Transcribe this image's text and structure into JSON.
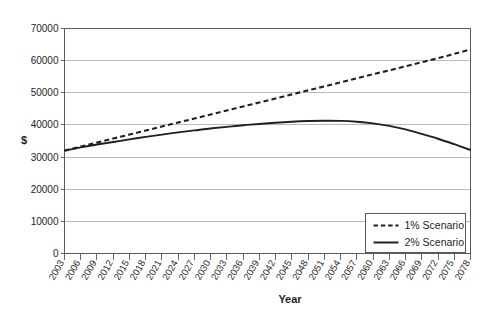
{
  "chart_data": {
    "type": "line",
    "title": "",
    "subtitle": "",
    "xlabel": "Year",
    "ylabel": "$",
    "xlim": [
      2003,
      2078
    ],
    "ylim": [
      0,
      70000
    ],
    "grid": true,
    "legend_position": "bottom-right",
    "ytick_labels": [
      "0",
      "10000",
      "20000",
      "30000",
      "40000",
      "50000",
      "60000",
      "70000"
    ],
    "ytick_values": [
      0,
      10000,
      20000,
      30000,
      40000,
      50000,
      60000,
      70000
    ],
    "categories": [
      "2003",
      "2006",
      "2009",
      "2012",
      "2015",
      "2018",
      "2021",
      "2024",
      "2027",
      "2030",
      "2033",
      "2036",
      "2039",
      "2042",
      "2045",
      "2048",
      "2051",
      "2054",
      "2057",
      "2060",
      "2063",
      "2066",
      "2069",
      "2072",
      "2075",
      "2078"
    ],
    "x": [
      2003,
      2006,
      2009,
      2012,
      2015,
      2018,
      2021,
      2024,
      2027,
      2030,
      2033,
      2036,
      2039,
      2042,
      2045,
      2048,
      2051,
      2054,
      2057,
      2060,
      2063,
      2066,
      2069,
      2072,
      2075,
      2078
    ],
    "series": [
      {
        "name": "1% Scenario",
        "style": "dashed",
        "color": "#231f20",
        "values": [
          32000,
          33250,
          34500,
          35750,
          37000,
          38250,
          39500,
          40750,
          42000,
          43250,
          44500,
          45750,
          47000,
          48250,
          49500,
          50750,
          52000,
          53250,
          54500,
          55750,
          57000,
          58250,
          59500,
          60750,
          62100,
          63500
        ]
      },
      {
        "name": "2% Scenario",
        "style": "solid",
        "color": "#231f20",
        "values": [
          32000,
          33000,
          33900,
          34700,
          35500,
          36300,
          37000,
          37700,
          38300,
          38900,
          39400,
          39900,
          40300,
          40700,
          41000,
          41200,
          41300,
          41250,
          41000,
          40500,
          39700,
          38600,
          37200,
          35700,
          34000,
          32200
        ]
      }
    ]
  },
  "legend": {
    "entries": [
      {
        "label": "1% Scenario",
        "style": "dashed"
      },
      {
        "label": "2% Scenario",
        "style": "solid"
      }
    ]
  },
  "axes": {
    "y_title": "$",
    "x_title": "Year"
  }
}
